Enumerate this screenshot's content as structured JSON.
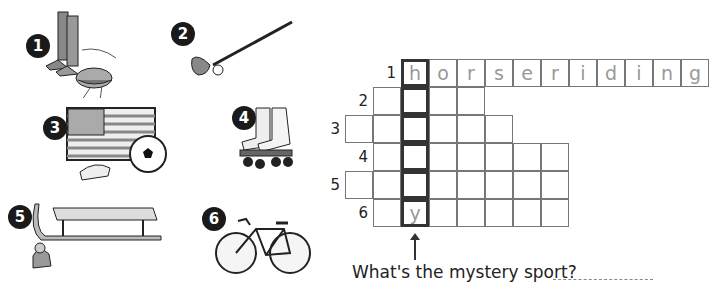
{
  "pictures": [
    {
      "number": "1",
      "label": "riding boots and hat",
      "icon": "riding-gear-icon"
    },
    {
      "number": "2",
      "label": "golf club and ball",
      "icon": "golf-club-icon"
    },
    {
      "number": "3",
      "label": "american flag, football boots and ball",
      "icon": "american-football-soccer-icon"
    },
    {
      "number": "4",
      "label": "roller skates",
      "icon": "roller-skates-icon"
    },
    {
      "number": "5",
      "label": "sledge and woolly hat",
      "icon": "sledge-icon"
    },
    {
      "number": "6",
      "label": "bicycle",
      "icon": "bicycle-icon"
    }
  ],
  "crossword": {
    "rows": [
      {
        "number": "1",
        "letters": [
          "h",
          "o",
          "r",
          "s",
          "e",
          "r",
          "i",
          "d",
          "i",
          "n",
          "g"
        ]
      },
      {
        "number": "2",
        "letters": [
          "",
          "",
          "",
          ""
        ]
      },
      {
        "number": "3",
        "letters": [
          "",
          "",
          "",
          "",
          "",
          ""
        ]
      },
      {
        "number": "4",
        "letters": [
          "",
          "",
          "",
          "",
          "",
          "",
          ""
        ]
      },
      {
        "number": "5",
        "letters": [
          "",
          "",
          "",
          "",
          "",
          "",
          "",
          ""
        ]
      },
      {
        "number": "6",
        "letters": [
          "",
          "y",
          "",
          "",
          "",
          "",
          ""
        ]
      }
    ]
  },
  "question": "What's the mystery sport?",
  "answer": ""
}
